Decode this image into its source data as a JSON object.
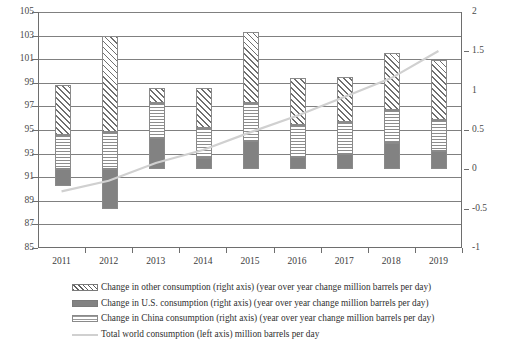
{
  "chart_data": {
    "type": "bar",
    "title": "",
    "subtitle": "",
    "xlabel": "",
    "ylabel": "",
    "y2label": "",
    "grid": true,
    "legend_position": "bottom-left",
    "categories": [
      "2011",
      "2012",
      "2013",
      "2014",
      "2015",
      "2016",
      "2017",
      "2018",
      "2019"
    ],
    "left_axis": {
      "ticks": [
        "105",
        "103",
        "101",
        "99",
        "97",
        "95",
        "93",
        "91",
        "89",
        "87",
        "85"
      ],
      "ylim": [
        85,
        105
      ],
      "step": 2,
      "units": "million barrels per day"
    },
    "right_axis": {
      "ticks": [
        "2",
        "1.5",
        "1",
        "0.5",
        "0",
        "-0.5",
        "-1"
      ],
      "ylim": [
        -1,
        2
      ],
      "step": 0.5,
      "units": "year over year change million barrels per day"
    },
    "series": [
      {
        "name": "Change in China consumption (right axis) (year over year change million barrels per day)",
        "key": "china",
        "axis": "right",
        "pattern": "horizontal-lines",
        "values": [
          0.44,
          0.47,
          0.44,
          0.38,
          0.48,
          0.4,
          0.4,
          0.43,
          0.4
        ]
      },
      {
        "name": "Change in U.S. consumption (right axis) (year over year change million barrels per day)",
        "key": "us",
        "axis": "right",
        "pattern": "solid-gray",
        "values": [
          -0.21,
          -0.5,
          0.4,
          0.15,
          0.36,
          0.16,
          0.2,
          0.33,
          0.23
        ]
      },
      {
        "name": "Change in other consumption (right axis) (year over year change million barrels per day)",
        "key": "other",
        "axis": "right",
        "pattern": "diagonal-hatch",
        "values": [
          0.63,
          1.23,
          0.19,
          0.51,
          0.91,
          0.6,
          0.58,
          0.72,
          0.76
        ]
      },
      {
        "name": "Total world consumption (left axis) million barrels per day",
        "key": "total",
        "axis": "left",
        "pattern": "line",
        "values": [
          89.8,
          90.7,
          92.2,
          93.3,
          94.8,
          96.2,
          97.8,
          99.4,
          101.7
        ]
      }
    ],
    "colors": {
      "us_fill": "#828282",
      "other_hatch": "#6f6f6f",
      "china_lines": "#8d8d8d",
      "total_line": "#d0d0d0",
      "gridline": "#808080",
      "axis": "#6e6e6e"
    }
  },
  "legend": [
    {
      "label": "Change in other consumption (right axis) (year over year change million barrels per day)",
      "swatch": "diagonal-hatch-swatch"
    },
    {
      "label": "Change in U.S. consumption (right axis) (year over year change million barrels per day)",
      "swatch": "solid-gray-swatch"
    },
    {
      "label": "Change in China consumption (right axis) (year over year change million barrels per day)",
      "swatch": "horizontal-lines-swatch"
    },
    {
      "label": "Total world consumption (left axis) million barrels per day",
      "swatch": "line-swatch"
    }
  ]
}
